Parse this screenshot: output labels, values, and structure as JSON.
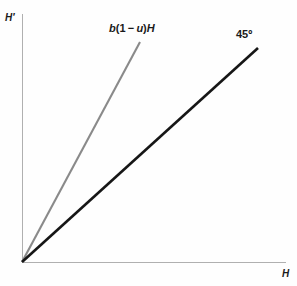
{
  "chart_data": {
    "type": "line",
    "title": "",
    "subtitle": "",
    "xlabel": "H",
    "ylabel": "H′",
    "grid": false,
    "legend_position": "inline-at-line-ends",
    "xlim": [
      0,
      1
    ],
    "ylim": [
      0,
      1
    ],
    "axis_ticks": {
      "x": [],
      "y": []
    },
    "origin": {
      "x": 0,
      "y": 0
    },
    "series": [
      {
        "name": "b(1 − u)H",
        "label_parts": {
          "coefficient": "b",
          "open_paren": "(",
          "one": "1",
          "minus": "−",
          "u": "u",
          "close_paren": ")",
          "variable": "H"
        },
        "slope": 1.82,
        "color": "#8a8a8a",
        "width": 2.1,
        "x": [
          0,
          1
        ],
        "values": [
          0,
          1.82
        ],
        "pixel_start": {
          "x": 22,
          "y": 262
        },
        "pixel_end": {
          "x": 140,
          "y": 42
        }
      },
      {
        "name": "45º",
        "slope": 1,
        "color": "#161616",
        "width": 2.6,
        "x": [
          0,
          1
        ],
        "values": [
          0,
          1
        ],
        "pixel_start": {
          "x": 22,
          "y": 262
        },
        "pixel_end": {
          "x": 258,
          "y": 48
        }
      }
    ],
    "annotations": [
      {
        "text": "b(1 − u)H",
        "series": 0,
        "position": "above-line-end"
      },
      {
        "text": "45º",
        "series": 1,
        "position": "above-line-end"
      }
    ],
    "axes_style": {
      "color": "#b0b0b0",
      "width": 1,
      "y_axis_pixels": {
        "x": 22,
        "y_top": 14,
        "y_bottom": 262
      },
      "x_axis_pixels": {
        "y": 262,
        "x_left": 22,
        "x_right": 286
      }
    },
    "background_color": "#fefefe"
  }
}
